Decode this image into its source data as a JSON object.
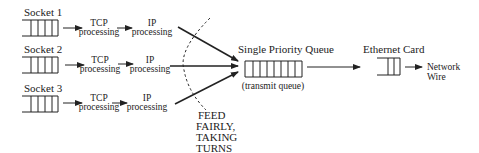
{
  "diagram": {
    "sockets": [
      {
        "label": "Socket 1",
        "tcp": [
          "TCP",
          "processing"
        ],
        "ip": [
          "IP",
          "processing"
        ]
      },
      {
        "label": "Socket 2",
        "tcp": [
          "TCP",
          "processing"
        ],
        "ip": [
          "IP",
          "processing"
        ]
      },
      {
        "label": "Socket 3",
        "tcp": [
          "TCP",
          "processing"
        ],
        "ip": [
          "IP",
          "processing"
        ]
      }
    ],
    "fairness_note": [
      "FEED",
      "FAIRLY,",
      "TAKING",
      "TURNS"
    ],
    "queue": {
      "title": "Single Priority Queue",
      "subtitle": "(transmit queue)"
    },
    "ethernet": {
      "title": "Ethernet Card"
    },
    "wire": [
      "Network",
      "Wire"
    ],
    "colors": {
      "ink": "#222222",
      "background": "#ffffff"
    }
  }
}
